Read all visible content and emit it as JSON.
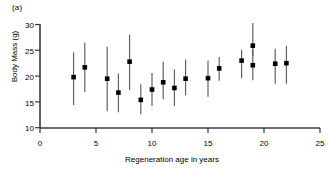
{
  "figure": {
    "panel_label": "(a)",
    "ylabel": "Body Mass (g)",
    "xlabel": "Regeneration age in years",
    "line_color": "#555555",
    "marker_color": "#000000",
    "axis_color": "#3a3a3a"
  },
  "chart_data": {
    "type": "scatter",
    "title": "",
    "subtitle": "",
    "panel": "(a)",
    "xlabel": "Regeneration age in years",
    "ylabel": "Body Mass (g)",
    "xlim": [
      0,
      25
    ],
    "ylim": [
      10,
      30
    ],
    "xticks": [
      0,
      5,
      10,
      15,
      20,
      25
    ],
    "yticks": [
      10,
      15,
      20,
      25,
      30
    ],
    "xtick_labels": [
      "0",
      "5",
      "10",
      "15",
      "20",
      "25"
    ],
    "ytick_labels": [
      "10",
      "15",
      "20",
      "25",
      "30"
    ],
    "grid": false,
    "legend": null,
    "marker": "filled-square",
    "errorbar": "vertical-range",
    "x": [
      3,
      4,
      6,
      7,
      8,
      9,
      10,
      11,
      12,
      13,
      15,
      16,
      18,
      19,
      19,
      21,
      22
    ],
    "y": [
      19.8,
      21.7,
      19.5,
      16.8,
      22.8,
      15.4,
      17.4,
      18.8,
      17.7,
      19.5,
      19.6,
      21.5,
      23.0,
      25.9,
      22.1,
      22.4,
      22.5
    ],
    "y_lower": [
      14.4,
      16.9,
      13.2,
      13.0,
      17.3,
      12.6,
      14.2,
      15.5,
      14.2,
      16.3,
      16.0,
      19.1,
      19.6,
      23.9,
      19.2,
      18.5,
      18.5
    ],
    "y_upper": [
      24.6,
      26.5,
      25.7,
      20.5,
      28.0,
      18.4,
      20.6,
      22.8,
      21.3,
      23.2,
      23.0,
      23.7,
      25.1,
      30.3,
      25.2,
      25.3,
      25.9
    ],
    "series": [
      {
        "name": "Body mass vs regeneration age",
        "points": [
          {
            "x": 3,
            "y": 19.8,
            "lower": 14.4,
            "upper": 24.6
          },
          {
            "x": 4,
            "y": 21.7,
            "lower": 16.9,
            "upper": 26.5
          },
          {
            "x": 6,
            "y": 19.5,
            "lower": 13.2,
            "upper": 25.7
          },
          {
            "x": 7,
            "y": 16.8,
            "lower": 13.0,
            "upper": 20.5
          },
          {
            "x": 8,
            "y": 22.8,
            "lower": 17.3,
            "upper": 28.0
          },
          {
            "x": 9,
            "y": 15.4,
            "lower": 12.6,
            "upper": 18.4
          },
          {
            "x": 10,
            "y": 17.4,
            "lower": 14.2,
            "upper": 20.6
          },
          {
            "x": 11,
            "y": 18.8,
            "lower": 15.5,
            "upper": 22.8
          },
          {
            "x": 12,
            "y": 17.7,
            "lower": 14.2,
            "upper": 21.3
          },
          {
            "x": 13,
            "y": 19.5,
            "lower": 16.3,
            "upper": 23.2
          },
          {
            "x": 15,
            "y": 19.6,
            "lower": 16.0,
            "upper": 23.0
          },
          {
            "x": 16,
            "y": 21.5,
            "lower": 19.1,
            "upper": 23.7
          },
          {
            "x": 18,
            "y": 23.0,
            "lower": 19.6,
            "upper": 25.1
          },
          {
            "x": 19,
            "y": 25.9,
            "lower": 23.9,
            "upper": 30.3
          },
          {
            "x": 19,
            "y": 22.1,
            "lower": 19.2,
            "upper": 25.2
          },
          {
            "x": 21,
            "y": 22.4,
            "lower": 18.5,
            "upper": 25.3
          },
          {
            "x": 22,
            "y": 22.5,
            "lower": 18.5,
            "upper": 25.9
          }
        ]
      }
    ]
  }
}
